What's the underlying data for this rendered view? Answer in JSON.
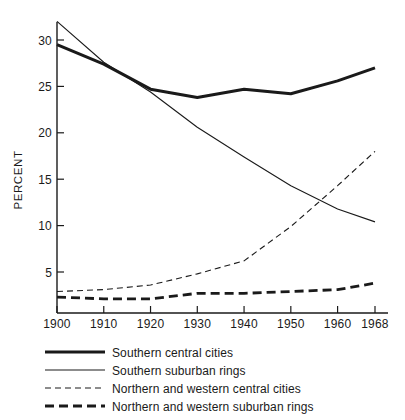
{
  "chart_data": {
    "type": "line",
    "title": "",
    "xlabel": "",
    "ylabel": "PERCENT",
    "xlim": [
      1900,
      1968
    ],
    "ylim": [
      1.5,
      32.5
    ],
    "grid": false,
    "legend_position": "below",
    "x_ticks": [
      "1900",
      "1910",
      "1920",
      "1930",
      "1940",
      "1950",
      "1960",
      "1968"
    ],
    "x_tick_values": [
      1900,
      1910,
      1920,
      1930,
      1940,
      1950,
      1960,
      1968
    ],
    "y_ticks": [
      "5",
      "10",
      "15",
      "20",
      "25",
      "30"
    ],
    "y_tick_values": [
      5,
      10,
      15,
      20,
      25,
      30
    ],
    "series": [
      {
        "name": "Southern central cities",
        "style": "thick-solid",
        "x": [
          1900,
          1910,
          1920,
          1930,
          1940,
          1950,
          1960,
          1968
        ],
        "values": [
          29.5,
          27.4,
          24.7,
          23.8,
          24.7,
          24.2,
          25.6,
          27.0
        ]
      },
      {
        "name": "Southern suburban rings",
        "style": "thin-solid",
        "x": [
          1900,
          1910,
          1920,
          1930,
          1940,
          1950,
          1960,
          1968
        ],
        "values": [
          32.0,
          27.6,
          24.4,
          20.6,
          17.4,
          14.3,
          11.8,
          10.4
        ]
      },
      {
        "name": "Northern and western central cities",
        "style": "thin-dashed",
        "x": [
          1900,
          1910,
          1920,
          1930,
          1940,
          1950,
          1960,
          1968
        ],
        "values": [
          2.9,
          3.1,
          3.6,
          4.8,
          6.2,
          9.9,
          14.3,
          18.0
        ]
      },
      {
        "name": "Northern and western suburban rings",
        "style": "thick-dashed",
        "x": [
          1900,
          1910,
          1920,
          1930,
          1940,
          1950,
          1960,
          1968
        ],
        "values": [
          2.3,
          2.1,
          2.1,
          2.7,
          2.7,
          2.9,
          3.1,
          3.8
        ]
      }
    ]
  },
  "legend": {
    "items": [
      {
        "label": "Southern central cities",
        "style": "thick-solid"
      },
      {
        "label": "Southern suburban rings",
        "style": "thin-solid"
      },
      {
        "label": "Northern and western central cities",
        "style": "thin-dashed"
      },
      {
        "label": "Northern and western suburban rings",
        "style": "thick-dashed"
      }
    ]
  },
  "colors": {
    "ink": "#1a1a1a",
    "background": "#ffffff"
  }
}
